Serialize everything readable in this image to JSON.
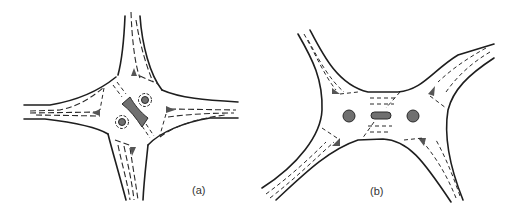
{
  "figures": [
    {
      "id": "a",
      "label": "(a)",
      "description": "Four-leg junction with two small roundabout islands and a central bow-tie island",
      "island_color": "#707070"
    },
    {
      "id": "b",
      "label": "(b)",
      "description": "Double-roundabout junction with two circular islands and a central elongated island",
      "island_color": "#707070"
    }
  ],
  "colors": {
    "line": "#1e1e1e",
    "background": "#ffffff",
    "island": "#707070"
  }
}
